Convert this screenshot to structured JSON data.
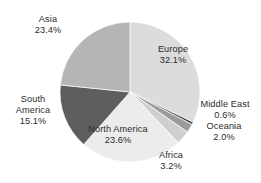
{
  "chart_data": {
    "type": "pie",
    "title": "",
    "subtitle": "",
    "xlabel": "",
    "ylabel": "",
    "legend_position": "none",
    "grid": false,
    "units": "percent",
    "start_angle_deg": 0,
    "direction": "clockwise",
    "categories": [
      "Europe",
      "Middle East",
      "Oceania",
      "Africa",
      "North America",
      "South America",
      "Asia"
    ],
    "values": [
      32.1,
      0.6,
      2.0,
      3.2,
      23.6,
      15.1,
      23.4
    ],
    "slices": [
      {
        "label": "Europe",
        "value": 32.1,
        "value_text": "32.1%",
        "color": "#dcdcdc"
      },
      {
        "label": "Middle East",
        "value": 0.6,
        "value_text": "0.6%",
        "color": "#4a4a4a"
      },
      {
        "label": "Oceania",
        "value": 2.0,
        "value_text": "2.0%",
        "color": "#9b9b9b"
      },
      {
        "label": "Africa",
        "value": 3.2,
        "value_text": "3.2%",
        "color": "#cfcfcf"
      },
      {
        "label": "North America",
        "value": 23.6,
        "value_text": "23.6%",
        "color": "#ececec"
      },
      {
        "label": "South America",
        "value": 15.1,
        "value_text": "15.1%",
        "color": "#5e5e5e"
      },
      {
        "label": "Asia",
        "value": 23.4,
        "value_text": "23.4%",
        "color": "#b5b5b5"
      }
    ]
  },
  "labels": {
    "asia": {
      "name": "Asia",
      "value": "23.4%"
    },
    "europe": {
      "name": "Europe",
      "value": "32.1%"
    },
    "south_america": {
      "name_line1": "South",
      "name_line2": "America",
      "value": "15.1%"
    },
    "north_america": {
      "name": "North America",
      "value": "23.6%"
    },
    "middle_east": {
      "name": "Middle East",
      "value": "0.6%"
    },
    "oceania": {
      "name": "Oceania",
      "value": "2.0%"
    },
    "africa": {
      "name": "Africa",
      "value": "3.2%"
    }
  },
  "colors": {
    "background": "#ffffff",
    "text": "#2b2b2b",
    "europe": "#dcdcdc",
    "middle_east": "#4a4a4a",
    "oceania": "#9b9b9b",
    "africa": "#cfcfcf",
    "north_america": "#ececec",
    "south_america": "#5e5e5e",
    "asia": "#b5b5b5"
  }
}
